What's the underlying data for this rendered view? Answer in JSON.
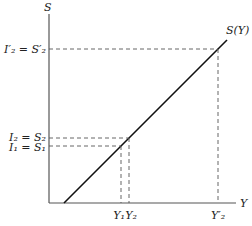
{
  "diagram": {
    "axes": {
      "y_label": "S",
      "x_label": "Y"
    },
    "curve": {
      "label": "S(Y)"
    },
    "levels": [
      {
        "id": "I2prime_S2prime",
        "label": "I′₂ = S′₂",
        "x_label": "Y′₂"
      },
      {
        "id": "I2_S2",
        "label": "I₂ = S₂",
        "x_label": "Y₂"
      },
      {
        "id": "I1_S1",
        "label": "I₁ = S₁",
        "x_label": "Y₁"
      }
    ],
    "colors": {
      "axis": "#555555",
      "curve": "#111111",
      "dash": "#555555",
      "text": "#222222"
    }
  }
}
